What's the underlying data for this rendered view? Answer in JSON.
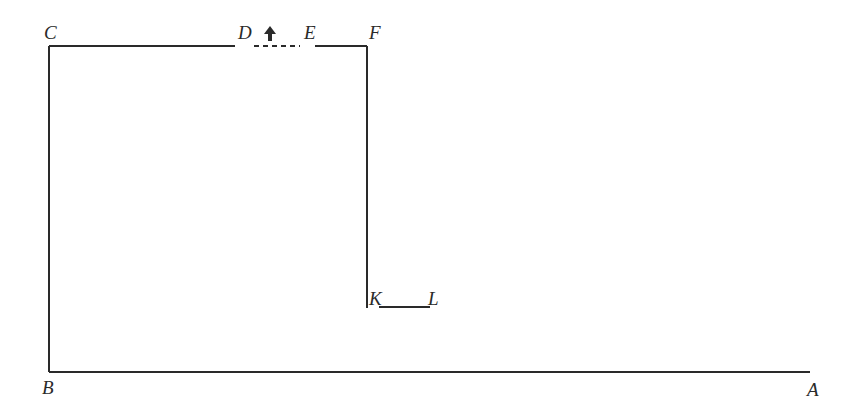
{
  "diagram": {
    "type": "floor-plan-outline",
    "stroke_color": "#2a2a2a",
    "labels": {
      "A": "A",
      "B": "B",
      "C": "C",
      "D": "D",
      "E": "E",
      "F": "F",
      "K": "K",
      "L": "L"
    },
    "arrow_icon": "up-arrow",
    "segments": [
      {
        "from": "B",
        "to": "A",
        "style": "solid"
      },
      {
        "from": "B",
        "to": "C",
        "style": "solid"
      },
      {
        "from": "C",
        "to": "D",
        "style": "solid"
      },
      {
        "from": "D",
        "to": "E",
        "style": "dashed"
      },
      {
        "from": "E",
        "to": "F",
        "style": "solid"
      },
      {
        "from": "F",
        "to": "K",
        "style": "solid"
      },
      {
        "from": "K",
        "to": "L",
        "style": "solid"
      }
    ]
  }
}
